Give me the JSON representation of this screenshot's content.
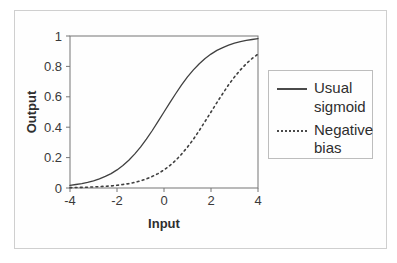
{
  "chart_data": {
    "type": "line",
    "title": "",
    "xlabel": "Input",
    "ylabel": "Output",
    "xlim": [
      -4,
      4
    ],
    "ylim": [
      0,
      1
    ],
    "x_ticks": [
      -4,
      -2,
      0,
      2,
      4
    ],
    "y_ticks": [
      0,
      0.2,
      0.4,
      0.6,
      0.8,
      1
    ],
    "grid": false,
    "legend_position": "right",
    "x": [
      -4,
      -3.75,
      -3.5,
      -3.25,
      -3,
      -2.75,
      -2.5,
      -2.25,
      -2,
      -1.75,
      -1.5,
      -1.25,
      -1,
      -0.75,
      -0.5,
      -0.25,
      0,
      0.25,
      0.5,
      0.75,
      1,
      1.25,
      1.5,
      1.75,
      2,
      2.25,
      2.5,
      2.75,
      3,
      3.25,
      3.5,
      3.75,
      4
    ],
    "series": [
      {
        "name": "Usual sigmoid",
        "line_style": "solid",
        "values": [
          0.018,
          0.023,
          0.029,
          0.037,
          0.047,
          0.06,
          0.076,
          0.095,
          0.119,
          0.148,
          0.182,
          0.223,
          0.269,
          0.321,
          0.378,
          0.438,
          0.5,
          0.562,
          0.622,
          0.679,
          0.731,
          0.777,
          0.818,
          0.852,
          0.881,
          0.905,
          0.924,
          0.94,
          0.953,
          0.963,
          0.971,
          0.977,
          0.982
        ]
      },
      {
        "name": "Negative bias",
        "line_style": "dotted",
        "values": [
          0.002,
          0.003,
          0.004,
          0.005,
          0.007,
          0.009,
          0.011,
          0.014,
          0.018,
          0.023,
          0.029,
          0.037,
          0.047,
          0.06,
          0.076,
          0.095,
          0.119,
          0.148,
          0.182,
          0.223,
          0.269,
          0.321,
          0.378,
          0.438,
          0.5,
          0.562,
          0.622,
          0.679,
          0.731,
          0.777,
          0.818,
          0.852,
          0.881
        ]
      }
    ]
  },
  "legend": {
    "entries": [
      {
        "label": "Usual sigmoid",
        "line_style": "solid"
      },
      {
        "label": "Negative bias",
        "line_style": "dotted"
      }
    ]
  },
  "colors": {
    "curve": "#404040",
    "axis": "#757575",
    "tick_text": "#3a3a3a",
    "frame_border": "#cfcfcf",
    "legend_border": "#bdbdbd",
    "background": "#fefefe"
  }
}
